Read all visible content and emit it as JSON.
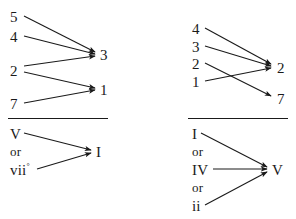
{
  "figure": {
    "stroke_color": "#1a1a1a",
    "background_color": "#ffffff"
  },
  "panels": [
    {
      "id": "top-left",
      "name": "scale-degree-resolution-major",
      "sources": [
        {
          "label": "5",
          "x": 10,
          "y": 10
        },
        {
          "label": "4",
          "x": 10,
          "y": 30
        },
        {
          "label": "2",
          "x": 10,
          "y": 64
        },
        {
          "label": "7",
          "x": 10,
          "y": 97
        }
      ],
      "targets": [
        {
          "label": "3",
          "x": 100,
          "y": 48
        },
        {
          "label": "1",
          "x": 100,
          "y": 83
        }
      ],
      "arrows": [
        {
          "from": "5",
          "to": "3",
          "x1": 24,
          "y1": 16,
          "x2": 95,
          "y2": 52
        },
        {
          "from": "4",
          "to": "3",
          "x1": 24,
          "y1": 36,
          "x2": 95,
          "y2": 54
        },
        {
          "from": "2",
          "to": "3",
          "x1": 24,
          "y1": 66,
          "x2": 95,
          "y2": 56
        },
        {
          "from": "2",
          "to": "1",
          "x1": 24,
          "y1": 72,
          "x2": 95,
          "y2": 88
        },
        {
          "from": "7",
          "to": "1",
          "x1": 24,
          "y1": 103,
          "x2": 95,
          "y2": 90
        }
      ]
    },
    {
      "id": "top-right",
      "name": "scale-degree-resolution-minor",
      "sources": [
        {
          "label": "4",
          "x": 192,
          "y": 22
        },
        {
          "label": "3",
          "x": 192,
          "y": 40
        },
        {
          "label": "2",
          "x": 192,
          "y": 57
        },
        {
          "label": "1",
          "x": 192,
          "y": 75
        }
      ],
      "targets": [
        {
          "label": "2",
          "x": 277,
          "y": 61
        },
        {
          "label": "7",
          "x": 277,
          "y": 92
        }
      ],
      "arrows": [
        {
          "from": "4",
          "to": "2",
          "x1": 205,
          "y1": 28,
          "x2": 271,
          "y2": 64
        },
        {
          "from": "3",
          "to": "2",
          "x1": 205,
          "y1": 46,
          "x2": 271,
          "y2": 66
        },
        {
          "from": "2",
          "to": "7",
          "x1": 205,
          "y1": 63,
          "x2": 271,
          "y2": 96
        },
        {
          "from": "1",
          "to": "2",
          "x1": 205,
          "y1": 81,
          "x2": 271,
          "y2": 68
        }
      ]
    },
    {
      "id": "bottom-left",
      "name": "chord-resolution-to-tonic",
      "rule": {
        "x": 8,
        "y": 118,
        "width": 100
      },
      "sources": [
        {
          "label": "V",
          "x": 10,
          "y": 127,
          "type": "chord"
        },
        {
          "label": "or",
          "x": 10,
          "y": 145,
          "type": "conjunction"
        },
        {
          "label": "vii",
          "superscript": "°",
          "x": 10,
          "y": 163,
          "type": "chord"
        }
      ],
      "targets": [
        {
          "label": "I",
          "x": 96,
          "y": 145
        }
      ],
      "arrows": [
        {
          "from": "V",
          "to": "I",
          "x1": 24,
          "y1": 133,
          "x2": 91,
          "y2": 150
        },
        {
          "from": "vii°",
          "to": "I",
          "x1": 37,
          "y1": 169,
          "x2": 91,
          "y2": 153
        }
      ]
    },
    {
      "id": "bottom-right",
      "name": "chord-resolution-to-dominant",
      "rule": {
        "x": 188,
        "y": 118,
        "width": 100
      },
      "sources": [
        {
          "label": "I",
          "x": 192,
          "y": 127,
          "type": "chord"
        },
        {
          "label": "or",
          "x": 192,
          "y": 145,
          "type": "conjunction"
        },
        {
          "label": "IV",
          "x": 192,
          "y": 163,
          "type": "chord"
        },
        {
          "label": "or",
          "x": 192,
          "y": 181,
          "type": "conjunction"
        },
        {
          "label": "ii",
          "x": 192,
          "y": 199,
          "type": "chord"
        }
      ],
      "targets": [
        {
          "label": "V",
          "x": 272,
          "y": 163
        }
      ],
      "arrows": [
        {
          "from": "I",
          "to": "V",
          "x1": 201,
          "y1": 133,
          "x2": 267,
          "y2": 167
        },
        {
          "from": "IV",
          "to": "V",
          "x1": 213,
          "y1": 169,
          "x2": 267,
          "y2": 169
        },
        {
          "from": "ii",
          "to": "V",
          "x1": 205,
          "y1": 205,
          "x2": 267,
          "y2": 172
        }
      ]
    }
  ]
}
